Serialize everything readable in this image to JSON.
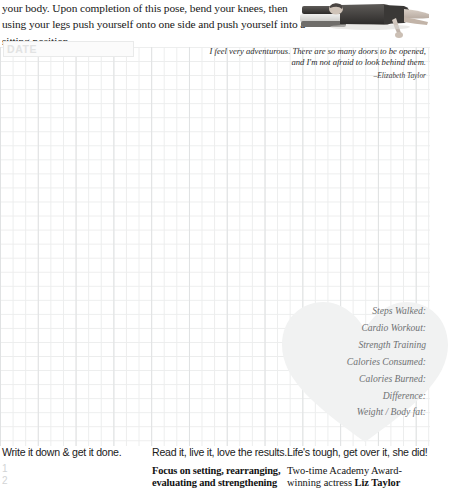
{
  "page": {
    "intro_paragraph": "your body. Upon completion of this pose, bend your knees, then using your legs push yourself onto one side and push yourself into a sitting position.",
    "photo_alt": "person-lying-on-mat-photo"
  },
  "date_field": {
    "label": "DATE",
    "value": ""
  },
  "quote": {
    "text": "I feel very adventurous. There are so many doors to be opened, and I'm not afraid to look behind them.",
    "attribution": "–Elizabeth Taylor"
  },
  "tracker": {
    "rows": [
      {
        "label": "Steps Walked:"
      },
      {
        "label": "Cardio Workout:"
      },
      {
        "label": "Strength Training"
      },
      {
        "label": "Calories Consumed:"
      },
      {
        "label": "Calories Burned:"
      },
      {
        "label": "Difference:"
      },
      {
        "label": "Weight / Body fat:"
      }
    ]
  },
  "footer": {
    "columns": [
      {
        "heading": "Write it down & get it done.",
        "body": "",
        "list": [
          "1",
          "2"
        ]
      },
      {
        "heading": "Read it, live it, love the results.",
        "body_line1": "Focus on setting, rearranging,",
        "body_line2": "evaluating and strengthening"
      },
      {
        "heading": "Life's tough, get over it, she did!",
        "body_line1": "Two-time Academy Award-",
        "body_line2_prefix": "winning actress ",
        "body_line2_name": "Liz Taylor"
      }
    ]
  },
  "colors": {
    "grid_line": "#eceded",
    "grid_major": "#e0e2e3",
    "heart_fill": "#f2f3f3",
    "tracker_text": "#6f7173",
    "date_label": "#e2e3e3",
    "numbered_list": "#d2d4d5",
    "body_text": "#121212"
  }
}
